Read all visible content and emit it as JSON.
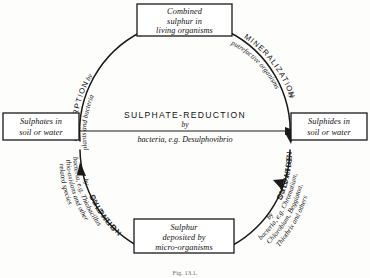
{
  "figure": {
    "caption": "Fig. 13.1.",
    "ink_color": "#1a1a1a",
    "paper_color": "#fdfdfc"
  },
  "nodes": {
    "top": {
      "name": "combined-sulphur-box",
      "lines": [
        "Combined",
        "sulphur in",
        "living organisms"
      ]
    },
    "left": {
      "name": "sulphates-box",
      "lines": [
        "Sulphates in",
        "soil or water"
      ]
    },
    "right": {
      "name": "sulphides-box",
      "lines": [
        "Sulphides in",
        "soil or water"
      ]
    },
    "bottom": {
      "name": "sulphur-deposited-box",
      "lines": [
        "Sulphur",
        "deposited by",
        "micro-organisms"
      ]
    }
  },
  "center_process": {
    "name": "sulphate-reduction",
    "title": "SULPHATE-REDUCTION",
    "by": "by",
    "agents": "bacteria, e.g. Desulphovibrio",
    "direction": "left-to-right"
  },
  "arcs": [
    {
      "name": "absorption",
      "quadrant": "upper-left",
      "title": "ABSORPTION",
      "by": "by",
      "agents": "plants and bacteria",
      "from": "Sulphates in soil or water",
      "to": "Combined sulphur in living organisms"
    },
    {
      "name": "mineralization",
      "quadrant": "upper-right",
      "title": "MINERALIZATION",
      "by": "by",
      "agents": "putrefactive organisms",
      "from": "Combined sulphur in living organisms",
      "to": "Sulphides in soil or water"
    },
    {
      "name": "sulphide-oxidation",
      "quadrant": "lower-right",
      "title_line1": "SULPHIDE-",
      "title_line2": "OXIDATION",
      "by": "by",
      "agents_line1": "bacteria, e.g. Chromatium,",
      "agents_line2": "Chlorobium, Beggiatoa,",
      "agents_line3": "Thiothrix and others",
      "from": "Sulphur deposited by micro-organisms",
      "to": "Sulphides in soil or water"
    },
    {
      "name": "sulphur-oxidation",
      "quadrant": "lower-left",
      "title_line1": "SULPHUR-",
      "title_line2": "OXIDATION",
      "by": "by",
      "agents_line1": "bacteria, e.g. Thiobacillus",
      "agents_line2": "thio-oxidans and other",
      "agents_line3": "related species",
      "from": "Sulphur deposited by micro-organisms",
      "to": "Sulphates in soil or water"
    }
  ]
}
